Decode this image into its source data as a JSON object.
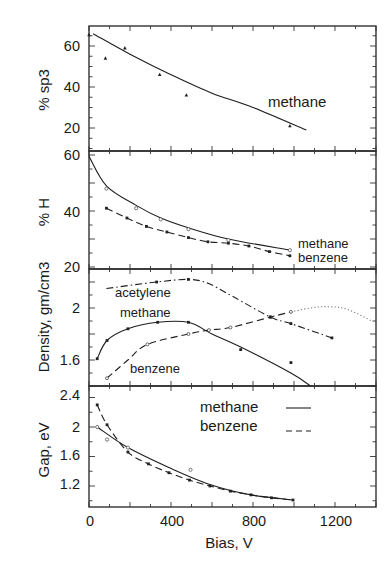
{
  "chart_data": [
    {
      "type": "line",
      "panel": "sp3",
      "ylabel": "% sp3",
      "ylim": [
        9,
        70
      ],
      "yticks": [
        20,
        40,
        60
      ],
      "annotations": [
        "methane"
      ],
      "series": [
        {
          "name": "methane",
          "style": "solid",
          "fit": {
            "x": [
              20,
              200,
              400,
              600,
              800,
              1060
            ],
            "y": [
              66,
              56,
              46,
              37,
              30,
              19
            ]
          },
          "points": {
            "x": [
              0,
              80,
              175,
              345,
              475,
              980
            ],
            "y": [
              65.5,
              54,
              59,
              46,
              36,
              21
            ]
          }
        }
      ]
    },
    {
      "type": "line",
      "panel": "hydrogen",
      "ylabel": "% H",
      "ylim": [
        19,
        61.5
      ],
      "yticks": [
        20,
        40,
        60
      ],
      "annotations": [
        "methane",
        "benzene"
      ],
      "series": [
        {
          "name": "methane",
          "style": "solid",
          "fit": {
            "x": [
              0,
              85,
              230,
              350,
              485,
              680,
              980
            ],
            "y": [
              59.5,
              49,
              42,
              37.5,
              34,
              30,
              26
            ]
          },
          "points": {
            "x": [
              85,
              230,
              350,
              485,
              680,
              980
            ],
            "y": [
              48,
              41,
              37,
              33.5,
              29.6,
              26
            ]
          }
        },
        {
          "name": "benzene",
          "style": "dashed",
          "fit": {
            "x": [
              85,
              185,
              280,
              380,
              485,
              580,
              680,
              780,
              880,
              980
            ],
            "y": [
              41,
              37.5,
              34.5,
              32.5,
              30.5,
              29,
              28.5,
              27.5,
              25.5,
              24
            ]
          },
          "points": {
            "x": [
              85,
              185,
              280,
              380,
              485,
              580,
              680,
              780,
              880,
              980
            ],
            "y": [
              41,
              37.5,
              34.5,
              32.5,
              30.5,
              29,
              28.5,
              27.5,
              25.5,
              24
            ]
          }
        }
      ]
    },
    {
      "type": "line",
      "panel": "density",
      "ylabel": "Density, gm/cm3",
      "ylim": [
        1.4,
        2.3
      ],
      "yticks": [
        1.6,
        2
      ],
      "annotations": [
        "acetylene",
        "methane",
        "benzene"
      ],
      "series": [
        {
          "name": "methane",
          "style": "solid",
          "fit": {
            "x": [
              40,
              88,
              190,
              335,
              485,
              600,
              740,
              985,
              1080
            ],
            "y": [
              1.61,
              1.75,
              1.84,
              1.89,
              1.89,
              1.8,
              1.7,
              1.5,
              1.4
            ]
          },
          "points": {
            "x": [
              40,
              88,
              190,
              335,
              485,
              740,
              985
            ],
            "y": [
              1.61,
              1.75,
              1.84,
              1.89,
              1.89,
              1.68,
              1.58
            ]
          }
        },
        {
          "name": "benzene",
          "style": "dashed",
          "fit": {
            "x": [
              88,
              190,
              285,
              485,
              585,
              690,
              885,
              985
            ],
            "y": [
              1.46,
              1.6,
              1.72,
              1.8,
              1.83,
              1.85,
              1.93,
              1.97
            ]
          },
          "points": {
            "x": [
              88,
              285,
              485,
              585,
              690,
              885,
              985
            ],
            "y": [
              1.46,
              1.72,
              1.8,
              1.83,
              1.85,
              1.93,
              1.97
            ]
          }
        },
        {
          "name": "benzene (extrapolation)",
          "style": "dotted",
          "fit": {
            "x": [
              985,
              1080,
              1165,
              1260,
              1380
            ],
            "y": [
              1.97,
              2.0,
              2.01,
              1.99,
              1.9
            ]
          }
        },
        {
          "name": "acetylene",
          "style": "dash-dot",
          "fit": {
            "x": [
              85,
              330,
              485,
              580,
              700,
              885,
              985,
              1185
            ],
            "y": [
              2.15,
              2.2,
              2.22,
              2.19,
              2.09,
              1.93,
              1.88,
              1.77
            ]
          },
          "points": {
            "x": [
              330,
              485,
              885,
              985,
              1185
            ],
            "y": [
              2.2,
              2.22,
              1.93,
              1.88,
              1.77
            ]
          }
        }
      ]
    },
    {
      "type": "line",
      "panel": "gap",
      "ylabel": "Gap, eV",
      "xlabel": "Bias, V",
      "xlim": [
        0,
        1400
      ],
      "xticks": [
        0,
        400,
        800,
        1200
      ],
      "ylim": [
        0.9,
        2.55
      ],
      "yticks": [
        1.2,
        1.6,
        2,
        2.4
      ],
      "legend": [
        {
          "label": "methane",
          "style": "solid"
        },
        {
          "label": "benzene",
          "style": "dashed"
        }
      ],
      "series": [
        {
          "name": "methane",
          "style": "solid",
          "fit": {
            "x": [
              40,
              190,
              390,
              590,
              790,
              995
            ],
            "y": [
              2.0,
              1.72,
              1.45,
              1.22,
              1.08,
              1.01
            ]
          },
          "points": {
            "x": [
              40,
              88,
              190,
              495
            ],
            "y": [
              2.0,
              1.83,
              1.72,
              1.42
            ]
          }
        },
        {
          "name": "benzene",
          "style": "dashed",
          "fit": {
            "x": [
              40,
              88,
              190,
              290,
              390,
              490,
              590,
              690,
              790,
              890,
              995
            ],
            "y": [
              2.3,
              2.03,
              1.66,
              1.5,
              1.38,
              1.28,
              1.2,
              1.13,
              1.08,
              1.04,
              1.01
            ]
          },
          "points": {
            "x": [
              40,
              88,
              190,
              290,
              390,
              490,
              590,
              690,
              790,
              890,
              995
            ],
            "y": [
              2.3,
              2.03,
              1.66,
              1.5,
              1.38,
              1.28,
              1.2,
              1.13,
              1.08,
              1.04,
              1.01
            ]
          }
        }
      ]
    }
  ],
  "labels": {
    "sp3": {
      "ylabel": "% sp3",
      "ticks": [
        "60",
        "40",
        "20"
      ],
      "annotation": "methane"
    },
    "hydrogen": {
      "ylabel": "% H",
      "ticks": [
        "60",
        "40",
        "20"
      ],
      "methane": "methane",
      "benzene": "benzene"
    },
    "density": {
      "ylabel": "Density, gm/cm3",
      "ticks": [
        "2",
        "1.6"
      ],
      "acetylene": "acetylene",
      "methane": "methane",
      "benzene": "benzene"
    },
    "gap": {
      "ylabel": "Gap, eV",
      "ticks": [
        "2.4",
        "2",
        "1.6",
        "1.2"
      ],
      "legend_methane": "methane",
      "legend_benzene": "benzene"
    },
    "xaxis": {
      "title": "Bias, V",
      "ticks": [
        "0",
        "400",
        "800",
        "1200"
      ]
    }
  }
}
